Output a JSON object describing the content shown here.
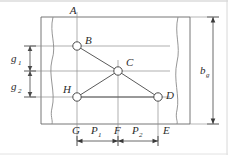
{
  "figure": {
    "type": "engineering-drawing",
    "background_color": "#ffffff",
    "line_color": "#555555",
    "label_color": "#2b2b2b",
    "node_fill": "#ffffff"
  },
  "nodes": [
    {
      "id": "A",
      "label": "A",
      "x": 77,
      "y": 17,
      "has_circle": false,
      "label_dx": -4,
      "label_dy": -3
    },
    {
      "id": "B",
      "label": "B",
      "x": 77,
      "y": 46,
      "has_circle": true,
      "label_dx": 8,
      "label_dy": -2
    },
    {
      "id": "C",
      "label": "C",
      "x": 118,
      "y": 71,
      "has_circle": true,
      "label_dx": 8,
      "label_dy": -5
    },
    {
      "id": "D",
      "label": "D",
      "x": 158,
      "y": 97,
      "has_circle": true,
      "label_dx": 8,
      "label_dy": 2
    },
    {
      "id": "E",
      "label": "E",
      "x": 158,
      "y": 124,
      "has_circle": false,
      "label_dx": 5,
      "label_dy": 10
    },
    {
      "id": "F",
      "label": "F",
      "x": 118,
      "y": 124,
      "has_circle": false,
      "label_dx": -4,
      "label_dy": 10
    },
    {
      "id": "G",
      "label": "G",
      "x": 77,
      "y": 124,
      "has_circle": false,
      "label_dx": -5,
      "label_dy": 10
    },
    {
      "id": "H",
      "label": "H",
      "x": 77,
      "y": 97,
      "has_circle": true,
      "label_dx": -14,
      "label_dy": -4
    }
  ],
  "dimensions": [
    {
      "id": "g1",
      "base": "g",
      "sub": "1",
      "orientation": "vertical",
      "from": "B",
      "to": "C",
      "label_x": 14,
      "label_y": 62
    },
    {
      "id": "g2",
      "base": "g",
      "sub": "2",
      "orientation": "vertical",
      "from": "C",
      "to": "H",
      "label_x": 14,
      "label_y": 90
    },
    {
      "id": "bg",
      "base": "b",
      "sub": "g",
      "orientation": "vertical",
      "from": "top-edge",
      "to": "bottom-edge",
      "label_x": 205,
      "label_y": 73
    },
    {
      "id": "P1",
      "base": "P",
      "sub": "1",
      "orientation": "horizontal",
      "from": "G",
      "to": "F",
      "label_x": 95,
      "label_y": 133
    },
    {
      "id": "P2",
      "base": "P",
      "sub": "2",
      "orientation": "horizontal",
      "from": "F",
      "to": "E",
      "label_x": 136,
      "label_y": 133
    }
  ],
  "edges": [
    {
      "from": "B",
      "to": "C"
    },
    {
      "from": "C",
      "to": "D"
    },
    {
      "from": "C",
      "to": "H"
    },
    {
      "from": "H",
      "to": "D"
    }
  ],
  "plate": {
    "top_y": 17,
    "bottom_y": 124,
    "left_x": 41,
    "right_x": 190,
    "break_left_x": 52,
    "break_right_x": 178
  }
}
